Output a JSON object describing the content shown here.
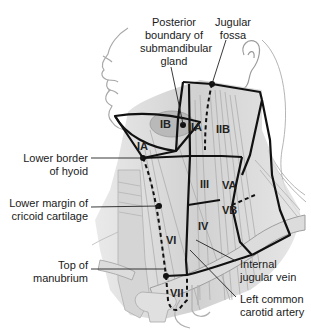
{
  "figure": {
    "type": "anatomical diagram"
  },
  "labels": {
    "posterior_boundary": "Posterior\nboundary of\nsubmandibular\ngland",
    "posterior_boundary_lines": [
      "Posterior",
      "boundary of",
      "submandibular",
      "gland"
    ],
    "jugular_fossa_lines": [
      "Jugular",
      "fossa"
    ],
    "lower_border_hyoid_lines": [
      "Lower border",
      "of hyoid"
    ],
    "lower_margin_cricoid_lines": [
      "Lower margin of",
      "cricoid cartilage"
    ],
    "top_manubrium_lines": [
      "Top of",
      "manubrium"
    ],
    "internal_jugular_lines": [
      "Internal",
      "jugular vein"
    ],
    "left_common_carotid_lines": [
      "Left common",
      "carotid artery"
    ]
  },
  "levels": {
    "IA": "IA",
    "IB": "IB",
    "IIA": "IIA",
    "IIB": "IIB",
    "III": "III",
    "IV": "IV",
    "VA": "VA",
    "VB": "VB",
    "VI": "VI",
    "VII": "VII"
  },
  "colors": {
    "outline": "#111111",
    "tissue_fill": "#d9d9d9",
    "muscle_fill": "#c4c4c4",
    "skin_line": "#9a9a9a",
    "background": "#ffffff"
  }
}
